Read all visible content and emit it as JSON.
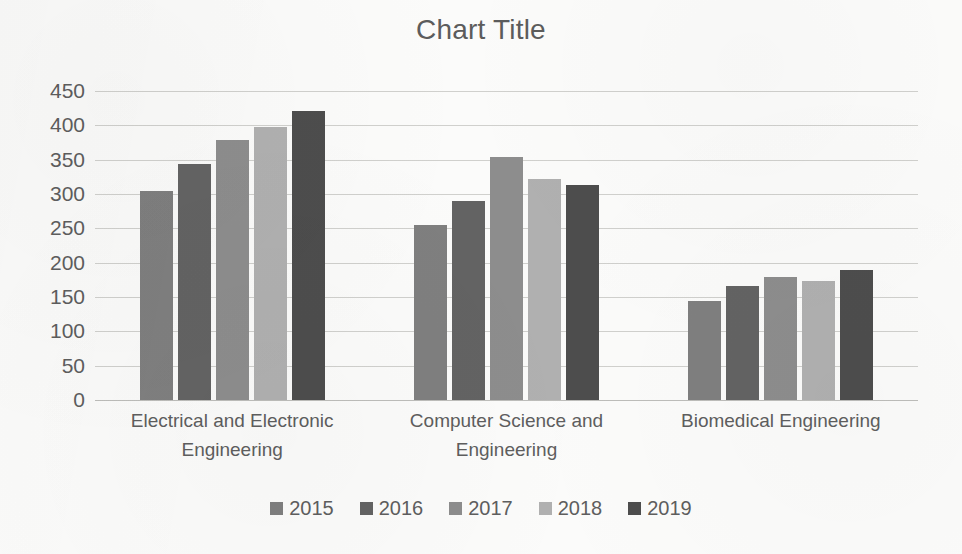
{
  "chart_data": {
    "type": "bar",
    "title": "Chart Title",
    "xlabel": "",
    "ylabel": "",
    "ylim": [
      0,
      450
    ],
    "yticks": [
      450,
      400,
      350,
      300,
      250,
      200,
      150,
      100,
      50,
      0
    ],
    "grid": true,
    "legend_position": "bottom",
    "categories": [
      "Electrical and Electronic Engineering",
      "Computer Science and Engineering",
      "Biomedical Engineering"
    ],
    "series": [
      {
        "name": "2015",
        "color": "#7f7f7f",
        "values": [
          304,
          255,
          144
        ]
      },
      {
        "name": "2016",
        "color": "#636363",
        "values": [
          343,
          290,
          166
        ]
      },
      {
        "name": "2017",
        "color": "#8d8d8d",
        "values": [
          378,
          354,
          179
        ]
      },
      {
        "name": "2018",
        "color": "#b0b0b0",
        "values": [
          397,
          322,
          174
        ]
      },
      {
        "name": "2019",
        "color": "#4d4d4d",
        "values": [
          421,
          313,
          189
        ]
      }
    ]
  },
  "axis": {
    "y_tick_labels": [
      "450",
      "400",
      "350",
      "300",
      "250",
      "200",
      "150",
      "100",
      "50",
      "0"
    ],
    "category_labels": [
      "Electrical and Electronic Engineering",
      "Computer Science and Engineering",
      "Biomedical Engineering"
    ]
  },
  "legend": {
    "entries": [
      {
        "label": "2015",
        "color": "#7f7f7f"
      },
      {
        "label": "2016",
        "color": "#636363"
      },
      {
        "label": "2017",
        "color": "#8d8d8d"
      },
      {
        "label": "2018",
        "color": "#b0b0b0"
      },
      {
        "label": "2019",
        "color": "#4d4d4d"
      }
    ]
  }
}
